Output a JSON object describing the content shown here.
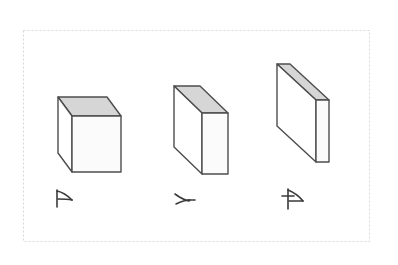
{
  "figure": {
    "title": "Three rectangular prisms of decreasing depth",
    "background_color": "#ffffff",
    "frame": {
      "name": "dashed-selection-frame",
      "x": 23,
      "y": 30,
      "width": 347,
      "height": 212,
      "stroke_color": "#d9d9d9",
      "dash_pattern": "2,2",
      "stroke_width": 1
    },
    "style": {
      "outline_color": "#4d4d4d",
      "top_face_color": "#d6d6d6",
      "front_face_color": "#fbfbfb",
      "side_face_color": "#ffffff",
      "sketch_color": "#3a3a3a",
      "outline_width": 1.4
    },
    "shapes": [
      {
        "id": "shape-1",
        "name": "cube-solid",
        "label": "A",
        "label_kind": "handwritten-glyph",
        "description": "Cube — full depth",
        "depth_rank": 1,
        "front": {
          "x": 72,
          "y": 116,
          "width": 49,
          "height": 56
        },
        "offset": {
          "dx": -14,
          "dy": -19
        }
      },
      {
        "id": "shape-2",
        "name": "slab-medium",
        "label": "A",
        "label_kind": "handwritten-glyph",
        "description": "Rectangular slab — medium depth",
        "depth_rank": 2,
        "front": {
          "x": 202,
          "y": 113,
          "width": 26,
          "height": 61
        },
        "offset": {
          "dx": -28,
          "dy": -27
        }
      },
      {
        "id": "shape-3",
        "name": "plate-thin",
        "label": "A",
        "label_kind": "handwritten-glyph",
        "description": "Thin plate — minimal depth",
        "depth_rank": 3,
        "front": {
          "x": 316,
          "y": 100,
          "width": 13,
          "height": 62
        },
        "offset": {
          "dx": -39,
          "dy": -36
        }
      }
    ],
    "labels": [
      {
        "id": "label-1",
        "name": "sketch-label-1",
        "text": "A",
        "x": 62,
        "y": 200
      },
      {
        "id": "label-2",
        "name": "sketch-label-2",
        "text": "A",
        "x": 178,
        "y": 200
      },
      {
        "id": "label-3",
        "name": "sketch-label-3",
        "text": "A",
        "x": 289,
        "y": 200
      }
    ]
  }
}
